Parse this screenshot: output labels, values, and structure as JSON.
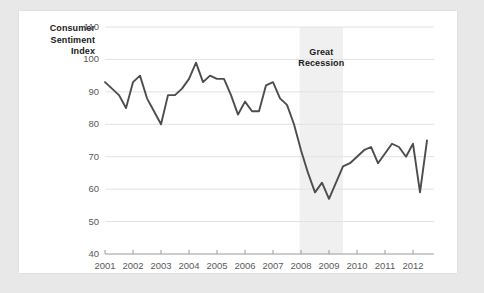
{
  "chart_data": {
    "type": "line",
    "title": "",
    "ylabel": "Consumer Sentiment Index",
    "xlabel": "",
    "ylim": [
      40,
      110
    ],
    "xlim": [
      2001,
      2012.75
    ],
    "yticks": [
      40,
      50,
      60,
      70,
      80,
      90,
      100,
      110
    ],
    "xticks": [
      2001,
      2002,
      2003,
      2004,
      2005,
      2006,
      2007,
      2008,
      2009,
      2010,
      2011,
      2012
    ],
    "grid": true,
    "legend": "none",
    "line_color": "#4d4d4d",
    "annotations": [
      {
        "text": "Great Recession",
        "type": "shaded-band",
        "x_start": 2007.95,
        "x_end": 2009.5,
        "color": "#f0f0f0"
      }
    ],
    "series": [
      {
        "name": "Consumer Sentiment Index",
        "x": [
          2001.0,
          2001.25,
          2001.5,
          2001.75,
          2002.0,
          2002.25,
          2002.5,
          2002.75,
          2003.0,
          2003.25,
          2003.5,
          2003.75,
          2004.0,
          2004.25,
          2004.5,
          2004.75,
          2005.0,
          2005.25,
          2005.5,
          2005.75,
          2006.0,
          2006.25,
          2006.5,
          2006.75,
          2007.0,
          2007.25,
          2007.5,
          2007.75,
          2008.0,
          2008.25,
          2008.5,
          2008.75,
          2009.0,
          2009.25,
          2009.5,
          2009.75,
          2010.0,
          2010.25,
          2010.5,
          2010.75,
          2011.0,
          2011.25,
          2011.5,
          2011.75,
          2012.0,
          2012.25,
          2012.5
        ],
        "values": [
          93,
          91,
          89,
          85,
          93,
          95,
          88,
          84,
          80,
          89,
          89,
          91,
          94,
          99,
          93,
          95,
          94,
          94,
          89,
          83,
          87,
          84,
          84,
          92,
          93,
          88,
          86,
          80,
          72,
          65,
          59,
          62,
          57,
          62,
          67,
          68,
          70,
          72,
          73,
          68,
          71,
          74,
          73,
          70,
          74,
          59,
          75
        ]
      }
    ]
  },
  "labels": {
    "y_axis_title_line1": "Consumer",
    "y_axis_title_line2": "Sentiment",
    "y_axis_title_line3": "Index",
    "band_line1": "Great",
    "band_line2": "Recession"
  }
}
